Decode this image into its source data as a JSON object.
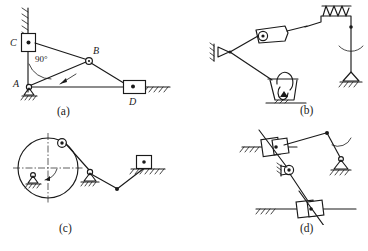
{
  "figure": {
    "panels": [
      {
        "id": "a",
        "caption": "(a)",
        "description": "Slider-crank type linkage with vertical and horizontal guides",
        "joint_labels": [
          "C",
          "B",
          "A",
          "D"
        ],
        "angle_label": "90°",
        "elements": [
          "vertical-guide-ground",
          "slider-block-C",
          "link-CB",
          "pin-joint-B",
          "link-AB",
          "link-BD",
          "fixed-pivot-A",
          "horizontal-guide-ground",
          "slider-block-D",
          "angle-arc-90"
        ]
      },
      {
        "id": "b",
        "caption": "(b)",
        "description": "Linkage with hydraulic cylinder, spring and dashpot damper",
        "joint_labels": [],
        "angle_label": "",
        "elements": [
          "fixed-pivot-left",
          "cylinder-piston",
          "spring-coil",
          "link-top",
          "rocker-link-right",
          "fixed-pivot-right",
          "dashpot-damper",
          "damper-ground"
        ]
      },
      {
        "id": "c",
        "caption": "(c)",
        "description": "Disc crank driving a rocker and a slider block",
        "joint_labels": [],
        "angle_label": "",
        "elements": [
          "crank-disc",
          "disc-centerline-horizontal",
          "disc-centerline-vertical",
          "disc-fixed-pivot",
          "rotation-arrow",
          "crank-pin",
          "coupler-link",
          "middle-fixed-pivot",
          "rocker-link",
          "connecting-link",
          "slider-block",
          "slider-guide-ground"
        ]
      },
      {
        "id": "d",
        "caption": "(d)",
        "description": "Two sliding blocks on guides connected through a pin joint",
        "joint_labels": [],
        "angle_label": "",
        "elements": [
          "upper-slider-guide-ground",
          "upper-slider-block",
          "upper-diagonal-link",
          "top-link",
          "top-pin-joint",
          "rocker-right",
          "fixed-pivot-right",
          "middle-pin-joint",
          "middle-link",
          "lower-slider-guide-ground",
          "lower-slider-block",
          "lower-diagonal-link"
        ]
      }
    ]
  }
}
